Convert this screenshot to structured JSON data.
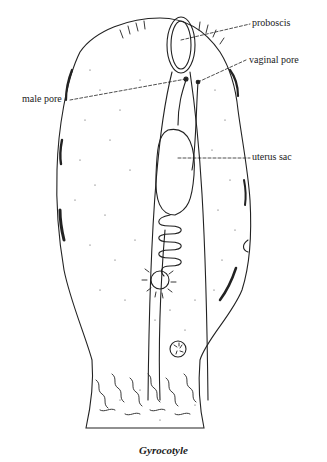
{
  "figure": {
    "caption": "Gyrocotyle",
    "labels": {
      "proboscis": "proboscis",
      "vaginal_pore": "vaginal pore",
      "male_pore": "male pore",
      "uterus_sac": "uterus sac"
    },
    "colors": {
      "ink": "#222222",
      "background": "#ffffff"
    }
  }
}
